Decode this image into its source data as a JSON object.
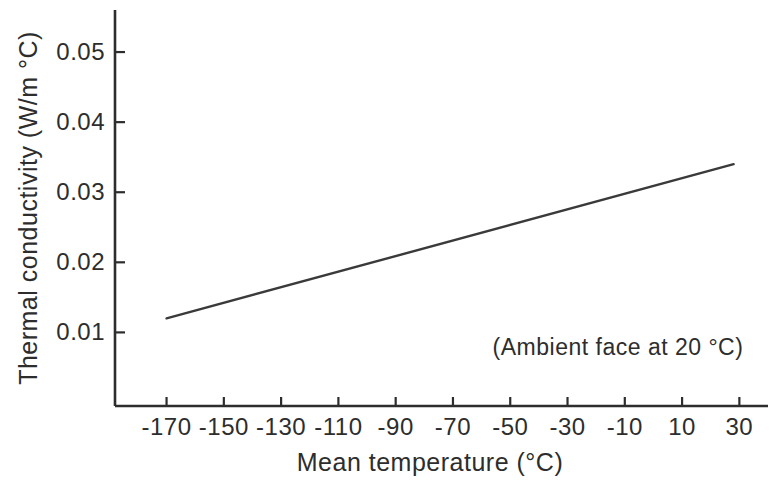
{
  "colors": {
    "background": "#ffffff",
    "axis": "#2d2d2d",
    "line": "#3a3a3a",
    "text": "#2d2d2d"
  },
  "chart_data": {
    "type": "line",
    "title": "",
    "xlabel": "Mean temperature (°C)",
    "ylabel": "Thermal conductivity (W/m °C)",
    "annotation": "(Ambient face at 20 °C)",
    "xlim": [
      -188,
      40
    ],
    "ylim": [
      -0.0005,
      0.056
    ],
    "grid": false,
    "legend": false,
    "x_ticks": [
      -170,
      -150,
      -130,
      -110,
      -90,
      -70,
      -50,
      -30,
      -10,
      10,
      30
    ],
    "x_tick_labels": [
      "-170",
      "-150",
      "-130",
      "-110",
      "-90",
      "-70",
      "-50",
      "-30",
      "-10",
      "10",
      "30"
    ],
    "y_ticks": [
      0.01,
      0.02,
      0.03,
      0.04,
      0.05
    ],
    "y_tick_labels": [
      "0.01",
      "0.02",
      "0.03",
      "0.04",
      "0.05"
    ],
    "series": [
      {
        "name": "conductivity",
        "x": [
          -170,
          28
        ],
        "y": [
          0.012,
          0.034
        ]
      }
    ]
  }
}
